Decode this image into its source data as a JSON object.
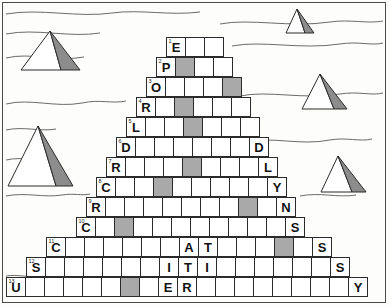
{
  "puzzle": {
    "title": "Pyramid Crossword Grid",
    "theme": "egypt-desert",
    "rows": 13,
    "max_width": 15,
    "cell_size_px": 20,
    "colors": {
      "cell_fill": "#ffffff",
      "cell_shaded": "#a9a9a9",
      "cell_border": "#2b2b2b",
      "frame_border": "#4a4a4a",
      "background": "#fdfdfb",
      "pyramid_shade": "#8c8c8c",
      "pyramid_light": "#ffffff",
      "dune_line": "#5a5a5a"
    },
    "grid": [
      {
        "row": 1,
        "left": 166,
        "top": 37,
        "count": 3,
        "cells": [
          {
            "num": "1",
            "letter": "E",
            "shaded": false
          },
          {
            "num": "",
            "letter": "",
            "shaded": false
          },
          {
            "num": "",
            "letter": "",
            "shaded": false
          }
        ]
      },
      {
        "row": 2,
        "left": 156,
        "top": 57,
        "count": 4,
        "cells": [
          {
            "num": "2",
            "letter": "P",
            "shaded": false
          },
          {
            "num": "",
            "letter": "",
            "shaded": true
          },
          {
            "num": "",
            "letter": "",
            "shaded": false
          },
          {
            "num": "",
            "letter": "",
            "shaded": false
          }
        ]
      },
      {
        "row": 3,
        "left": 146,
        "top": 77,
        "count": 5,
        "cells": [
          {
            "num": "3",
            "letter": "O",
            "shaded": false
          },
          {
            "num": "",
            "letter": "",
            "shaded": false
          },
          {
            "num": "",
            "letter": "",
            "shaded": false
          },
          {
            "num": "",
            "letter": "",
            "shaded": false
          },
          {
            "num": "",
            "letter": "",
            "shaded": true
          }
        ]
      },
      {
        "row": 4,
        "left": 136,
        "top": 97,
        "count": 6,
        "cells": [
          {
            "num": "4",
            "letter": "R",
            "shaded": false
          },
          {
            "num": "",
            "letter": "",
            "shaded": false
          },
          {
            "num": "",
            "letter": "",
            "shaded": true
          },
          {
            "num": "",
            "letter": "",
            "shaded": false
          },
          {
            "num": "",
            "letter": "",
            "shaded": false
          },
          {
            "num": "",
            "letter": "",
            "shaded": false
          }
        ]
      },
      {
        "row": 5,
        "left": 126,
        "top": 117,
        "count": 7,
        "cells": [
          {
            "num": "5",
            "letter": "L",
            "shaded": false
          },
          {
            "num": "",
            "letter": "",
            "shaded": false
          },
          {
            "num": "",
            "letter": "",
            "shaded": false
          },
          {
            "num": "",
            "letter": "",
            "shaded": true
          },
          {
            "num": "",
            "letter": "",
            "shaded": false
          },
          {
            "num": "",
            "letter": "",
            "shaded": false
          },
          {
            "num": "",
            "letter": "",
            "shaded": false
          }
        ]
      },
      {
        "row": 6,
        "left": 116,
        "top": 137,
        "count": 8,
        "cells": [
          {
            "num": "6",
            "letter": "D",
            "shaded": false
          },
          {
            "num": "",
            "letter": "",
            "shaded": false
          },
          {
            "num": "",
            "letter": "",
            "shaded": false
          },
          {
            "num": "",
            "letter": "",
            "shaded": false
          },
          {
            "num": "",
            "letter": "",
            "shaded": false
          },
          {
            "num": "",
            "letter": "",
            "shaded": false
          },
          {
            "num": "",
            "letter": "",
            "shaded": false
          },
          {
            "num": "",
            "letter": "D",
            "shaded": false
          }
        ]
      },
      {
        "row": 7,
        "left": 106,
        "top": 157,
        "count": 9,
        "cells": [
          {
            "num": "7",
            "letter": "R",
            "shaded": false
          },
          {
            "num": "",
            "letter": "",
            "shaded": false
          },
          {
            "num": "",
            "letter": "",
            "shaded": false
          },
          {
            "num": "",
            "letter": "",
            "shaded": false
          },
          {
            "num": "",
            "letter": "",
            "shaded": true
          },
          {
            "num": "",
            "letter": "",
            "shaded": false
          },
          {
            "num": "",
            "letter": "",
            "shaded": false
          },
          {
            "num": "",
            "letter": "",
            "shaded": false
          },
          {
            "num": "",
            "letter": "L",
            "shaded": false
          }
        ]
      },
      {
        "row": 8,
        "left": 96,
        "top": 177,
        "count": 10,
        "cells": [
          {
            "num": "8",
            "letter": "C",
            "shaded": false
          },
          {
            "num": "",
            "letter": "",
            "shaded": false
          },
          {
            "num": "",
            "letter": "",
            "shaded": false
          },
          {
            "num": "",
            "letter": "",
            "shaded": true
          },
          {
            "num": "",
            "letter": "",
            "shaded": false
          },
          {
            "num": "",
            "letter": "",
            "shaded": false
          },
          {
            "num": "",
            "letter": "",
            "shaded": false
          },
          {
            "num": "",
            "letter": "",
            "shaded": false
          },
          {
            "num": "",
            "letter": "",
            "shaded": false
          },
          {
            "num": "",
            "letter": "Y",
            "shaded": false
          }
        ]
      },
      {
        "row": 9,
        "left": 86,
        "top": 197,
        "count": 11,
        "cells": [
          {
            "num": "9",
            "letter": "R",
            "shaded": false
          },
          {
            "num": "",
            "letter": "",
            "shaded": false
          },
          {
            "num": "",
            "letter": "",
            "shaded": false
          },
          {
            "num": "",
            "letter": "",
            "shaded": false
          },
          {
            "num": "",
            "letter": "",
            "shaded": false
          },
          {
            "num": "",
            "letter": "",
            "shaded": false
          },
          {
            "num": "",
            "letter": "",
            "shaded": false
          },
          {
            "num": "",
            "letter": "",
            "shaded": false
          },
          {
            "num": "",
            "letter": "",
            "shaded": true
          },
          {
            "num": "",
            "letter": "",
            "shaded": false
          },
          {
            "num": "",
            "letter": "N",
            "shaded": false
          }
        ]
      },
      {
        "row": 10,
        "left": 76,
        "top": 217,
        "count": 12,
        "cells": [
          {
            "num": "10",
            "letter": "C",
            "shaded": false
          },
          {
            "num": "",
            "letter": "",
            "shaded": false
          },
          {
            "num": "",
            "letter": "",
            "shaded": true
          },
          {
            "num": "",
            "letter": "",
            "shaded": false
          },
          {
            "num": "",
            "letter": "",
            "shaded": false
          },
          {
            "num": "",
            "letter": "",
            "shaded": false
          },
          {
            "num": "",
            "letter": "",
            "shaded": false
          },
          {
            "num": "",
            "letter": "",
            "shaded": false
          },
          {
            "num": "",
            "letter": "",
            "shaded": false
          },
          {
            "num": "",
            "letter": "",
            "shaded": false
          },
          {
            "num": "",
            "letter": "",
            "shaded": false
          },
          {
            "num": "",
            "letter": "S",
            "shaded": false
          }
        ]
      },
      {
        "row": 11,
        "left": 46,
        "top": 237,
        "count": 15,
        "cells": [
          {
            "num": "11",
            "letter": "C",
            "shaded": false
          },
          {
            "num": "",
            "letter": "",
            "shaded": false
          },
          {
            "num": "",
            "letter": "",
            "shaded": false
          },
          {
            "num": "",
            "letter": "",
            "shaded": false
          },
          {
            "num": "",
            "letter": "",
            "shaded": false
          },
          {
            "num": "",
            "letter": "",
            "shaded": false
          },
          {
            "num": "",
            "letter": "",
            "shaded": false
          },
          {
            "num": "",
            "letter": "A",
            "shaded": false
          },
          {
            "num": "",
            "letter": "T",
            "shaded": false
          },
          {
            "num": "",
            "letter": "",
            "shaded": false
          },
          {
            "num": "",
            "letter": "",
            "shaded": false
          },
          {
            "num": "",
            "letter": "",
            "shaded": false
          },
          {
            "num": "",
            "letter": "",
            "shaded": true
          },
          {
            "num": "",
            "letter": "",
            "shaded": false
          },
          {
            "num": "",
            "letter": "S",
            "shaded": false
          }
        ]
      },
      {
        "row": 12,
        "left": 26,
        "top": 257,
        "count": 17,
        "cells": [
          {
            "num": "12",
            "letter": "S",
            "shaded": false
          },
          {
            "num": "",
            "letter": "",
            "shaded": false
          },
          {
            "num": "",
            "letter": "",
            "shaded": false
          },
          {
            "num": "",
            "letter": "",
            "shaded": false
          },
          {
            "num": "",
            "letter": "",
            "shaded": false
          },
          {
            "num": "",
            "letter": "",
            "shaded": false
          },
          {
            "num": "",
            "letter": "",
            "shaded": false
          },
          {
            "num": "",
            "letter": "I",
            "shaded": false
          },
          {
            "num": "",
            "letter": "T",
            "shaded": false
          },
          {
            "num": "",
            "letter": "I",
            "shaded": false
          },
          {
            "num": "",
            "letter": "",
            "shaded": false
          },
          {
            "num": "",
            "letter": "",
            "shaded": false
          },
          {
            "num": "",
            "letter": "",
            "shaded": false
          },
          {
            "num": "",
            "letter": "",
            "shaded": false
          },
          {
            "num": "",
            "letter": "",
            "shaded": false
          },
          {
            "num": "",
            "letter": "",
            "shaded": false
          },
          {
            "num": "",
            "letter": "S",
            "shaded": false
          }
        ]
      },
      {
        "row": 13,
        "left": 6,
        "top": 277,
        "count": 19,
        "cells": [
          {
            "num": "13",
            "letter": "U",
            "shaded": false
          },
          {
            "num": "",
            "letter": "",
            "shaded": false
          },
          {
            "num": "",
            "letter": "",
            "shaded": false
          },
          {
            "num": "",
            "letter": "",
            "shaded": false
          },
          {
            "num": "",
            "letter": "",
            "shaded": false
          },
          {
            "num": "",
            "letter": "",
            "shaded": false
          },
          {
            "num": "",
            "letter": "",
            "shaded": true
          },
          {
            "num": "",
            "letter": "",
            "shaded": false
          },
          {
            "num": "",
            "letter": "E",
            "shaded": false
          },
          {
            "num": "",
            "letter": "R",
            "shaded": false
          },
          {
            "num": "",
            "letter": "",
            "shaded": false
          },
          {
            "num": "",
            "letter": "",
            "shaded": false
          },
          {
            "num": "",
            "letter": "",
            "shaded": false
          },
          {
            "num": "",
            "letter": "",
            "shaded": false
          },
          {
            "num": "",
            "letter": "",
            "shaded": false
          },
          {
            "num": "",
            "letter": "",
            "shaded": false
          },
          {
            "num": "",
            "letter": "",
            "shaded": false
          },
          {
            "num": "",
            "letter": "",
            "shaded": false
          },
          {
            "num": "",
            "letter": "Y",
            "shaded": false
          }
        ]
      }
    ],
    "pyramids": [
      {
        "id": "pyramid-top-left",
        "apex_x": 50,
        "apex_y": 31,
        "base_left": 21,
        "base_right": 80,
        "base_y": 70,
        "ridge_x": 61
      },
      {
        "id": "pyramid-mid-left",
        "apex_x": 38,
        "apex_y": 126,
        "base_left": 8,
        "base_right": 73,
        "base_y": 186,
        "ridge_x": 56
      },
      {
        "id": "pyramid-top-right",
        "apex_x": 297,
        "apex_y": 9,
        "base_left": 286,
        "base_right": 314,
        "base_y": 33,
        "ridge_x": 305
      },
      {
        "id": "pyramid-mid-right",
        "apex_x": 320,
        "apex_y": 74,
        "base_left": 302,
        "base_right": 347,
        "base_y": 109,
        "ridge_x": 334
      },
      {
        "id": "pyramid-low-right",
        "apex_x": 338,
        "apex_y": 156,
        "base_left": 321,
        "base_right": 366,
        "base_y": 192,
        "ridge_x": 352
      }
    ],
    "dunes": [
      "M6,14 C40,8 78,18 112,13 C140,9 170,16 200,12",
      "M6,34 C36,28 70,38 100,33",
      "M220,24 C250,18 290,28 330,22 C350,19 368,24 383,21",
      "M6,58 C30,52 58,62 84,57",
      "M232,46 C262,40 300,50 340,44 C358,41 372,46 383,43",
      "M6,104 C30,98 56,108 82,103 C100,99 112,104 126,101",
      "M6,130 C24,126 40,132 56,129",
      "M240,96 C268,90 304,100 340,94 C358,91 372,96 383,93",
      "M6,160 C24,156 40,162 58,159",
      "M246,142 C272,136 300,146 330,140 C346,137 360,142 372,139",
      "M6,196 C26,192 44,198 62,195 C74,193 82,196 90,194",
      "M300,196 C320,192 338,198 356,195",
      "M6,276 C18,274 28,278 40,276"
    ]
  }
}
